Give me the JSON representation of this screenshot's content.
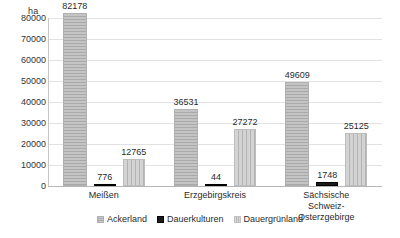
{
  "chart_data": {
    "type": "bar",
    "title": "",
    "subtitle": "",
    "xlabel": "",
    "ylabel": "ha",
    "unit_label": "ha",
    "ylim": [
      0,
      80000
    ],
    "ytick_step": 10000,
    "yticks": [
      "80000",
      "70000",
      "60000",
      "50000",
      "40000",
      "30000",
      "20000",
      "10000",
      "0"
    ],
    "ytick_values": [
      80000,
      70000,
      60000,
      50000,
      40000,
      30000,
      20000,
      10000,
      0
    ],
    "grid": true,
    "grid_axis": "y",
    "legend_position": "bottom",
    "categories": [
      "Meißen",
      "Erzgebirgskreis",
      "Sächsische Schweiz-Osterzgebirge"
    ],
    "category_labels_wrapped": [
      "Meißen",
      "Erzgebirgskreis",
      "Sächsische Schweiz-\nOsterzgebirge"
    ],
    "series": [
      {
        "name": "Ackerland",
        "values": [
          82178,
          36531,
          49609
        ],
        "labels": [
          "82178",
          "36531",
          "49609"
        ],
        "color": "#bfbfbf",
        "pattern": "horizontal-stripes"
      },
      {
        "name": "Dauerkulturen",
        "values": [
          776,
          44,
          1748
        ],
        "labels": [
          "776",
          "44",
          "1748"
        ],
        "color": "#1a1a1a",
        "pattern": "solid"
      },
      {
        "name": "Dauergrünland",
        "values": [
          12765,
          27272,
          25125
        ],
        "labels": [
          "12765",
          "27272",
          "25125"
        ],
        "color": "#cfcfcf",
        "pattern": "vertical-stripes"
      }
    ]
  }
}
